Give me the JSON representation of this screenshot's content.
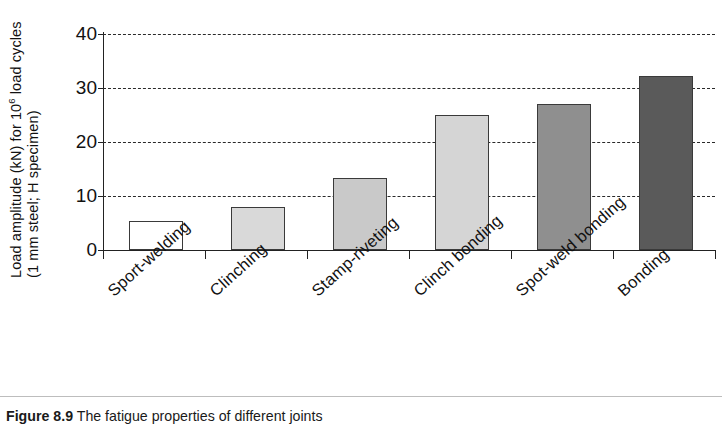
{
  "figure": {
    "caption_number": "Figure 8.9",
    "caption_text": "The fatigue properties of different joints"
  },
  "axis": {
    "y_title_line1": "Load amplitude (kN) for 10",
    "y_title_line1_sup": "6",
    "y_title_line1_tail": " load cycles",
    "y_title_line2": "(1 mm steel; H specimen)",
    "y_ticks": [
      "0",
      "10",
      "20",
      "30",
      "40"
    ]
  },
  "chart_data": {
    "type": "bar",
    "title": "",
    "xlabel": "",
    "ylabel": "Load amplitude (kN) for 10⁶ load cycles (1 mm steel; H specimen)",
    "ylim": [
      0,
      40
    ],
    "ytick_values": [
      0,
      10,
      20,
      30,
      40
    ],
    "grid": true,
    "legend": false,
    "categories": [
      "Sport-welding",
      "Clinching",
      "Stamp-riveting",
      "Clinch bonding",
      "Spot-weld bonding",
      "Bonding"
    ],
    "values": [
      5.4,
      8.0,
      13.3,
      25.0,
      27.0,
      32.3
    ],
    "bar_fills": [
      "#ffffff",
      "#d9d9d9",
      "#c9c9c9",
      "#d5d5d5",
      "#8f8f8f",
      "#5a5a5a"
    ],
    "bar_edge_color": "#3a3a3a"
  }
}
